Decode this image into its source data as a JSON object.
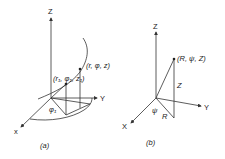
{
  "figure_a": {
    "caption": "(a)",
    "axes": {
      "z": "Z",
      "y": "Y",
      "x": "x"
    },
    "point_1_label": "(r₁, φ₁, z₁)",
    "point_label": "(r, φ, z)",
    "angle_label": "φ₁"
  },
  "figure_b": {
    "caption": "(b)",
    "axes": {
      "z": "Z",
      "y": "Y",
      "x": "X"
    },
    "point_label": "(R, ψ, Z)",
    "height_label": "Z",
    "radius_label": "R",
    "angle_label": "ψ"
  }
}
